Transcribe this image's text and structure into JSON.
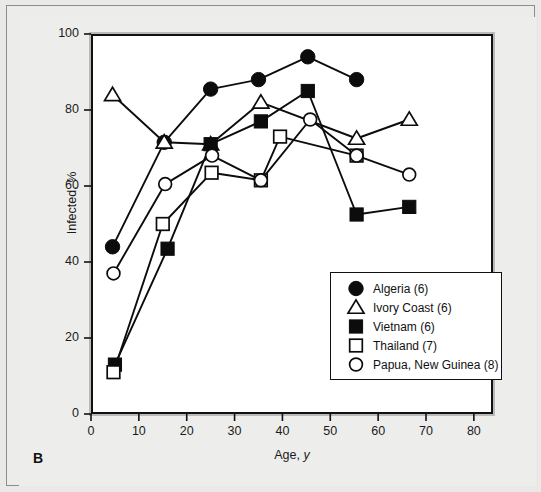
{
  "figure": {
    "panel_letter": "B",
    "xlabel_prefix": "Age, ",
    "xlabel_italic": "y",
    "ylabel": "Infected, %"
  },
  "legend": {
    "entries": [
      {
        "label": "Algeria (6)",
        "marker": "filled-circle",
        "series": "algeria"
      },
      {
        "label": "Ivory Coast (6)",
        "marker": "open-triangle",
        "series": "ivory_coast"
      },
      {
        "label": "Vietnam (6)",
        "marker": "filled-square",
        "series": "vietnam"
      },
      {
        "label": "Thailand (7)",
        "marker": "open-square",
        "series": "thailand"
      },
      {
        "label": "Papua, New Guinea (8)",
        "marker": "open-circle",
        "series": "papua_new_guinea"
      }
    ]
  },
  "axes": {
    "x": {
      "ticks": [
        "0",
        "10",
        "20",
        "30",
        "40",
        "50",
        "60",
        "70",
        "80"
      ],
      "min": 0,
      "max": 84
    },
    "y": {
      "ticks": [
        "0",
        "20",
        "40",
        "60",
        "80",
        "100"
      ],
      "min": 0,
      "max": 100
    }
  },
  "chart_data": {
    "type": "line",
    "title": "",
    "subtitle": "",
    "xlabel": "Age, y",
    "ylabel": "Infected, %",
    "xlim": [
      0,
      84
    ],
    "ylim": [
      0,
      100
    ],
    "xticks": [
      0,
      10,
      20,
      30,
      40,
      50,
      60,
      70,
      80
    ],
    "yticks": [
      0,
      20,
      40,
      60,
      80,
      100
    ],
    "grid": false,
    "legend_position": "lower-right inside",
    "annotations": [
      "B"
    ],
    "series": [
      {
        "name": "Algeria (6)",
        "marker": "filled-circle",
        "n": 6,
        "x": [
          4.5,
          15.3,
          25.0,
          35.0,
          45.3,
          55.5
        ],
        "values": [
          44,
          71.5,
          85.5,
          88,
          94,
          88
        ]
      },
      {
        "name": "Ivory Coast (6)",
        "marker": "open-triangle",
        "n": 6,
        "x": [
          4.5,
          15.3,
          25.0,
          35.5,
          55.5,
          66.5
        ],
        "values": [
          84,
          71.5,
          71,
          82,
          72.5,
          77.5
        ]
      },
      {
        "name": "Vietnam (6)",
        "marker": "filled-square",
        "n": 6,
        "x": [
          5.0,
          16.0,
          25.0,
          35.5,
          45.3,
          55.5,
          66.5
        ],
        "values": [
          13,
          43.5,
          71,
          77,
          85,
          52.5,
          54.5
        ]
      },
      {
        "name": "Thailand (7)",
        "marker": "open-square",
        "n": 7,
        "x": [
          4.7,
          15.0,
          25.2,
          35.5,
          39.5,
          55.5
        ],
        "values": [
          11,
          50,
          63.5,
          61.5,
          73,
          68
        ]
      },
      {
        "name": "Papua, New Guinea (8)",
        "marker": "open-circle",
        "n": 8,
        "x": [
          4.7,
          15.5,
          25.3,
          35.5,
          45.8,
          55.5,
          66.5
        ],
        "values": [
          37,
          60.5,
          68,
          61.5,
          77.5,
          68,
          63
        ]
      }
    ]
  }
}
